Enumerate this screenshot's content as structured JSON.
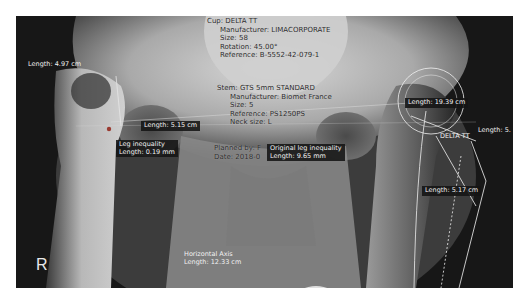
{
  "viewer": {
    "side_marker": "R",
    "cup_info": {
      "title": "Cup: DELTA TT",
      "manufacturer": "Manufacturer: LIMACORPORATE",
      "size": "Size: 58",
      "rotation": "Rotation: 45.00°",
      "reference": "Reference: B-5552-42-079-1"
    },
    "stem_info": {
      "title": "Stem: GTS 5mm STANDARD",
      "manufacturer": "Manufacturer: Biomet France",
      "size": "Size: 5",
      "reference": "Reference: PS1250PS",
      "neck": "Neck size: L"
    },
    "plan_info": {
      "planned_by": "Planned by: F",
      "date": "Date: 2018-0"
    },
    "measurements": [
      {
        "id": "left-length",
        "lines": [
          "Length: 4.97 cm"
        ]
      },
      {
        "id": "mid-length",
        "lines": [
          "Length: 5.15 cm"
        ]
      },
      {
        "id": "leg-inequality",
        "lines": [
          "Leg inequality",
          "Length: 0.19 mm"
        ]
      },
      {
        "id": "original-leg-inequality",
        "lines": [
          "Original leg inequality",
          "Length: 9.65 mm"
        ]
      },
      {
        "id": "right-length-19",
        "lines": [
          "Length: 19.39 cm"
        ]
      },
      {
        "id": "right-length-5",
        "lines": [
          "Length: 5."
        ]
      },
      {
        "id": "implant-label",
        "lines": [
          "DELTA TT"
        ]
      },
      {
        "id": "right-length-517",
        "lines": [
          "Length: 5.17 cm"
        ]
      },
      {
        "id": "horizontal-axis",
        "lines": [
          "Horizontal Axis",
          "Length: 12.33 cm"
        ]
      }
    ],
    "colors": {
      "overlay_line": "#e6e6e6",
      "label_bg": "#141414",
      "marker_dot": "#9a3a30"
    }
  }
}
